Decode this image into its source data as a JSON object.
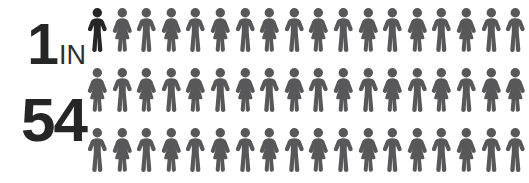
{
  "background_color": "#ffffff",
  "ratio": {
    "numerator": "1",
    "connector": "IN",
    "denominator": "54",
    "text_color": "#262626"
  },
  "pictogram": {
    "total_figures": 54,
    "columns": 18,
    "rows": 3,
    "highlighted_count": 1,
    "default_color": "#58585a",
    "highlight_color": "#262626",
    "rows_data": [
      {
        "row_index": 0,
        "figures": [
          {
            "gender": "male",
            "highlighted": true
          },
          {
            "gender": "female",
            "highlighted": false
          },
          {
            "gender": "male",
            "highlighted": false
          },
          {
            "gender": "female",
            "highlighted": false
          },
          {
            "gender": "male",
            "highlighted": false
          },
          {
            "gender": "female",
            "highlighted": false
          },
          {
            "gender": "male",
            "highlighted": false
          },
          {
            "gender": "female",
            "highlighted": false
          },
          {
            "gender": "male",
            "highlighted": false
          },
          {
            "gender": "female",
            "highlighted": false
          },
          {
            "gender": "male",
            "highlighted": false
          },
          {
            "gender": "female",
            "highlighted": false
          },
          {
            "gender": "male",
            "highlighted": false
          },
          {
            "gender": "female",
            "highlighted": false
          },
          {
            "gender": "male",
            "highlighted": false
          },
          {
            "gender": "female",
            "highlighted": false
          },
          {
            "gender": "male",
            "highlighted": false
          },
          {
            "gender": "male",
            "highlighted": false
          }
        ]
      },
      {
        "row_index": 1,
        "figures": [
          {
            "gender": "female",
            "highlighted": false
          },
          {
            "gender": "male",
            "highlighted": false
          },
          {
            "gender": "female",
            "highlighted": false
          },
          {
            "gender": "male",
            "highlighted": false
          },
          {
            "gender": "female",
            "highlighted": false
          },
          {
            "gender": "male",
            "highlighted": false
          },
          {
            "gender": "female",
            "highlighted": false
          },
          {
            "gender": "male",
            "highlighted": false
          },
          {
            "gender": "female",
            "highlighted": false
          },
          {
            "gender": "male",
            "highlighted": false
          },
          {
            "gender": "female",
            "highlighted": false
          },
          {
            "gender": "male",
            "highlighted": false
          },
          {
            "gender": "female",
            "highlighted": false
          },
          {
            "gender": "male",
            "highlighted": false
          },
          {
            "gender": "female",
            "highlighted": false
          },
          {
            "gender": "male",
            "highlighted": false
          },
          {
            "gender": "female",
            "highlighted": false
          },
          {
            "gender": "female",
            "highlighted": false
          }
        ]
      },
      {
        "row_index": 2,
        "figures": [
          {
            "gender": "male",
            "highlighted": false
          },
          {
            "gender": "female",
            "highlighted": false
          },
          {
            "gender": "male",
            "highlighted": false
          },
          {
            "gender": "female",
            "highlighted": false
          },
          {
            "gender": "male",
            "highlighted": false
          },
          {
            "gender": "female",
            "highlighted": false
          },
          {
            "gender": "male",
            "highlighted": false
          },
          {
            "gender": "female",
            "highlighted": false
          },
          {
            "gender": "male",
            "highlighted": false
          },
          {
            "gender": "female",
            "highlighted": false
          },
          {
            "gender": "male",
            "highlighted": false
          },
          {
            "gender": "female",
            "highlighted": false
          },
          {
            "gender": "male",
            "highlighted": false
          },
          {
            "gender": "female",
            "highlighted": false
          },
          {
            "gender": "male",
            "highlighted": false
          },
          {
            "gender": "female",
            "highlighted": false
          },
          {
            "gender": "male",
            "highlighted": false
          },
          {
            "gender": "male",
            "highlighted": false
          }
        ]
      }
    ]
  }
}
